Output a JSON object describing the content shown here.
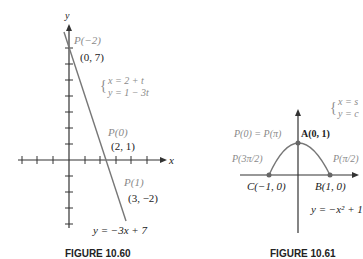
{
  "figure_60": {
    "caption": "FIGURE 10.60",
    "axis_x": "x",
    "axis_y": "y",
    "labels": {
      "p_neg2": "P(−2)",
      "pt_0_7": "(0, 7)",
      "param_x": "x = 2 + t",
      "param_y": "y = 1 − 3t",
      "p0": "P(0)",
      "pt_2_1": "(2, 1)",
      "p1": "P(1)",
      "pt_3_neg2": "(3, −2)",
      "equation": "y = −3x + 7"
    }
  },
  "figure_61": {
    "caption": "FIGURE 10.61",
    "labels": {
      "param_x": "x = s",
      "param_y": "y = c",
      "p0_ppi": "P(0) = P(π)",
      "A": "A(0, 1)",
      "p_3pi2": "P(3π/2)",
      "p_pi2": "P(π/2)",
      "C": "C(−1, 0)",
      "B": "B(1, 0)",
      "equation": "y = −x² + 1"
    }
  },
  "colors": {
    "curve": "#7a7a7a",
    "axis": "#333333",
    "label_gray": "#8a8a8a"
  }
}
